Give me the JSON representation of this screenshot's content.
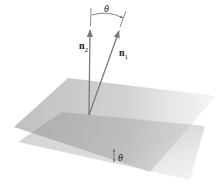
{
  "figure": {
    "labels": {
      "normal_1": "n",
      "normal_1_sub": "1",
      "normal_2": "n",
      "normal_2_sub": "2",
      "angle_top": "θ",
      "angle_bottom": "θ"
    },
    "colors": {
      "plane": "#9a9a9a",
      "vector": "#7a7a7a",
      "text": "#222222"
    }
  }
}
